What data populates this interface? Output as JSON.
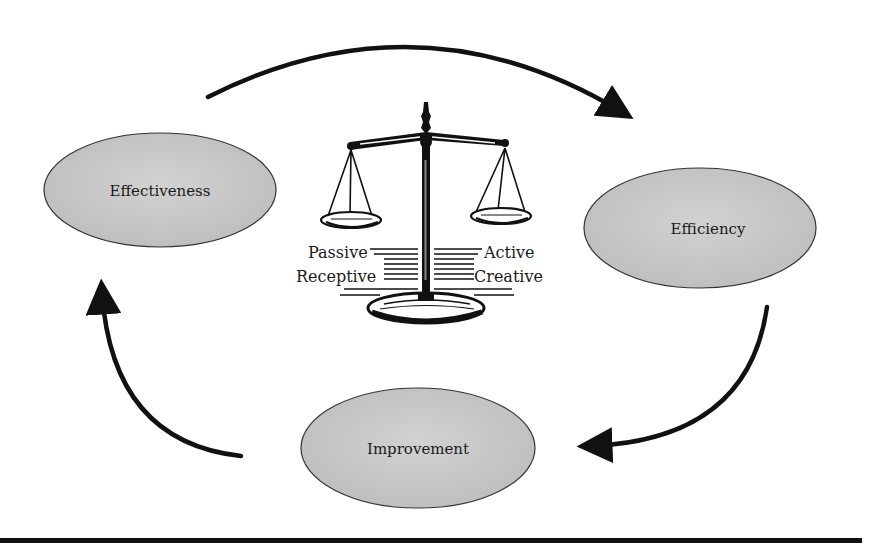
{
  "diagram": {
    "type": "cycle",
    "nodes": [
      {
        "id": "effectiveness",
        "label": "Effectiveness"
      },
      {
        "id": "efficiency",
        "label": "Efficiency"
      },
      {
        "id": "improvement",
        "label": "Improvement"
      }
    ],
    "edges": [
      {
        "from": "effectiveness",
        "to": "efficiency"
      },
      {
        "from": "efficiency",
        "to": "improvement"
      },
      {
        "from": "improvement",
        "to": "effectiveness"
      }
    ],
    "center_image": {
      "icon": "balance-scale-icon",
      "left_labels": [
        "Passive",
        "Receptive"
      ],
      "right_labels": [
        "Active",
        "Creative"
      ]
    },
    "colors": {
      "ellipse_fill": "#c8c8c8",
      "ellipse_stroke": "#333333",
      "arrow": "#111111",
      "rule": "#111111"
    }
  }
}
